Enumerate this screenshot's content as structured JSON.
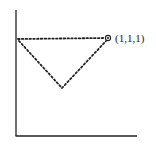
{
  "diagram": {
    "type": "geometric-diagram",
    "point_label": "(1,1,1)",
    "colors": {
      "ink": "#222222",
      "background": "#ffffff"
    },
    "vertices": [
      {
        "name": "top-left",
        "x": 17,
        "y": 39
      },
      {
        "name": "top-right",
        "x": 108,
        "y": 38
      },
      {
        "name": "bottom",
        "x": 62,
        "y": 88
      }
    ]
  }
}
